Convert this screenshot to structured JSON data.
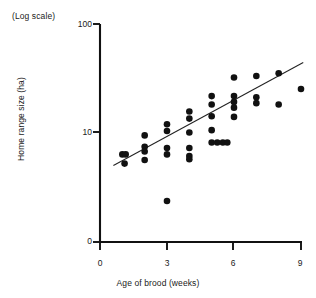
{
  "chart_data": {
    "type": "scatter",
    "title": "",
    "subtitle": "",
    "note": "(Log scale)",
    "xlabel": "Age of brood (weeks)",
    "ylabel": "Home range size (ha)",
    "grid": false,
    "legend": null,
    "legend_position": "none",
    "x_scale": "linear",
    "y_scale": "log",
    "xlim": [
      0,
      9.6
    ],
    "ylim_log": [
      3.0,
      100
    ],
    "x_ticks": [
      0,
      3,
      6,
      9
    ],
    "x_tick_labels": [
      "0",
      "3",
      "6",
      "9"
    ],
    "y_ticks": [
      10,
      100
    ],
    "y_tick_labels": [
      "10",
      "100"
    ],
    "y_axis_origin_label": "0",
    "series": [
      {
        "name": "Home range size vs age of brood",
        "marker": "filled-circle",
        "color": "#111111",
        "points": [
          [
            1.0,
            6.2
          ],
          [
            1.15,
            6.2
          ],
          [
            1.1,
            5.1
          ],
          [
            2.0,
            9.3
          ],
          [
            2.0,
            7.3
          ],
          [
            2.0,
            6.6
          ],
          [
            2.0,
            5.5
          ],
          [
            3.0,
            11.8
          ],
          [
            3.0,
            10.2
          ],
          [
            3.0,
            7.1
          ],
          [
            3.0,
            6.2
          ],
          [
            3.0,
            2.3
          ],
          [
            4.0,
            15.5
          ],
          [
            4.0,
            13.3
          ],
          [
            4.0,
            9.9
          ],
          [
            4.0,
            7.1
          ],
          [
            4.0,
            6.0
          ],
          [
            4.0,
            5.6
          ],
          [
            5.0,
            21.5
          ],
          [
            5.0,
            18.0
          ],
          [
            5.0,
            14.0
          ],
          [
            5.0,
            10.4
          ],
          [
            5.0,
            8.0
          ],
          [
            5.25,
            8.0
          ],
          [
            5.5,
            8.0
          ],
          [
            5.7,
            8.0
          ],
          [
            6.0,
            32.0
          ],
          [
            6.0,
            21.5
          ],
          [
            6.0,
            19.0
          ],
          [
            6.0,
            16.8
          ],
          [
            6.0,
            13.8
          ],
          [
            7.0,
            33.0
          ],
          [
            7.0,
            21.0
          ],
          [
            7.0,
            18.5
          ],
          [
            8.0,
            35.0
          ],
          [
            8.0,
            18.0
          ],
          [
            9.0,
            25.0
          ]
        ]
      }
    ],
    "trendline": {
      "name": "regression line",
      "x_start": 0.6,
      "y_start": 4.9,
      "x_end": 9.1,
      "y_end": 44.0
    },
    "annotations": []
  },
  "axes": {
    "y_tick_100": "100",
    "y_tick_10": "10",
    "y_tick_0": "0",
    "x_tick_0": "0",
    "x_tick_3": "3",
    "x_tick_6": "6",
    "x_tick_9": "9"
  },
  "labels": {
    "log_scale_note": "(Log scale)",
    "x_axis_title": "Age of brood (weeks)",
    "y_axis_title": "Home range size (ha)"
  },
  "colors": {
    "marker": "#111111",
    "axis": "#111111",
    "trendline": "#222222",
    "background": "#ffffff"
  }
}
